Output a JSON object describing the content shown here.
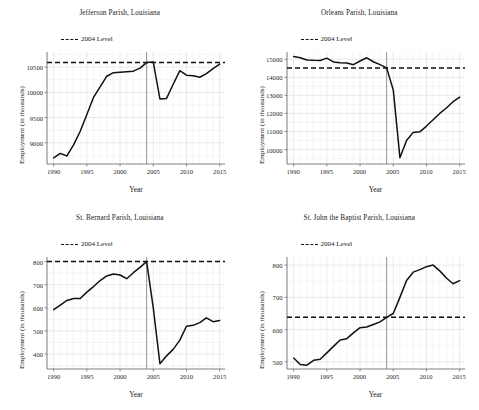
{
  "figure": {
    "shared_xlabel": "Year",
    "shared_ylabel": "Employment (in thousands)",
    "legend_label": "2004 Level",
    "line_color": "#111111",
    "level_color": "#111111",
    "vline_color": "#7a7a82",
    "grid_color": "#d9d9e0"
  },
  "chart_data": [
    {
      "type": "line",
      "title": "Jefferson Parish, Louisiana",
      "xlabel": "Year",
      "ylabel": "Employment (in thousands)",
      "legend": [
        "2004 Level"
      ],
      "legend_position": "top-left",
      "grid": true,
      "xlim": [
        1989.0,
        2015.8
      ],
      "ylim": [
        8580,
        10800
      ],
      "xticks": [
        1990,
        1995,
        2000,
        2005,
        2010,
        2015
      ],
      "yticks": [
        9000,
        9500,
        10000,
        10500
      ],
      "level_2004": 10590,
      "vline_x": 2004,
      "x": [
        1990,
        1991,
        1992,
        1993,
        1994,
        1995,
        1996,
        1997,
        1998,
        1999,
        2000,
        2001,
        2002,
        2003,
        2004,
        2005,
        2006,
        2007,
        2008,
        2009,
        2010,
        2011,
        2012,
        2013,
        2014,
        2015
      ],
      "values": [
        8700,
        8790,
        8740,
        8960,
        9230,
        9560,
        9900,
        10110,
        10320,
        10390,
        10400,
        10410,
        10420,
        10480,
        10590,
        10600,
        9870,
        9880,
        10160,
        10430,
        10340,
        10330,
        10300,
        10370,
        10470,
        10560,
        10700
      ]
    },
    {
      "type": "line",
      "title": "Orleans Parish, Louisiana",
      "xlabel": "Year",
      "ylabel": "Employment (in thousands)",
      "legend": [
        "2004 Level"
      ],
      "legend_position": "top-left",
      "grid": true,
      "xlim": [
        1989.0,
        2015.8
      ],
      "ylim": [
        9200,
        15400
      ],
      "xticks": [
        1990,
        1995,
        2000,
        2005,
        2010,
        2015
      ],
      "yticks": [
        10000,
        11000,
        12000,
        13000,
        14000,
        15000
      ],
      "level_2004": 14520,
      "vline_x": 2004,
      "x": [
        1990,
        1991,
        1992,
        1993,
        1994,
        1995,
        1996,
        1997,
        1998,
        1999,
        2000,
        2001,
        2002,
        2003,
        2004,
        2005,
        2006,
        2007,
        2008,
        2009,
        2010,
        2011,
        2012,
        2013,
        2014,
        2015
      ],
      "values": [
        15150,
        15080,
        14960,
        14940,
        14930,
        15060,
        14850,
        14800,
        14790,
        14700,
        14900,
        15080,
        14860,
        14700,
        14520,
        13300,
        9550,
        10500,
        10950,
        10980,
        11300,
        11650,
        12000,
        12300,
        12650,
        12900
      ]
    },
    {
      "type": "line",
      "title": "St. Bernard Parish, Louisiana",
      "xlabel": "Year",
      "ylabel": "Employment (in thousands)",
      "legend": [
        "2004 Level"
      ],
      "legend_position": "top-left",
      "grid": true,
      "xlim": [
        1989.0,
        2015.8
      ],
      "ylim": [
        335,
        820
      ],
      "xticks": [
        1990,
        1995,
        2000,
        2005,
        2010,
        2015
      ],
      "yticks": [
        400,
        500,
        600,
        700,
        800
      ],
      "level_2004": 800,
      "vline_x": 2004,
      "x": [
        1990,
        1991,
        1992,
        1993,
        1994,
        1995,
        1996,
        1997,
        1998,
        1999,
        2000,
        2001,
        2002,
        2003,
        2004,
        2005,
        2006,
        2007,
        2008,
        2009,
        2010,
        2011,
        2012,
        2013,
        2014,
        2015
      ],
      "values": [
        592,
        612,
        632,
        640,
        640,
        668,
        692,
        718,
        738,
        746,
        742,
        726,
        752,
        775,
        800,
        600,
        358,
        392,
        420,
        460,
        520,
        524,
        536,
        556,
        540,
        545
      ]
    },
    {
      "type": "line",
      "title": "St. John the Baptist Parish, Louisiana",
      "xlabel": "Year",
      "ylabel": "Employment (in thousands)",
      "legend": [
        "2004 Level"
      ],
      "legend_position": "top-left",
      "grid": true,
      "xlim": [
        1989.0,
        2015.8
      ],
      "ylim": [
        478,
        825
      ],
      "xticks": [
        1990,
        1995,
        2000,
        2005,
        2010,
        2015
      ],
      "yticks": [
        500,
        600,
        700,
        800
      ],
      "level_2004": 638,
      "vline_x": 2004,
      "x": [
        1990,
        1991,
        1992,
        1993,
        1994,
        1995,
        1996,
        1997,
        1998,
        1999,
        2000,
        2001,
        2002,
        2003,
        2004,
        2005,
        2006,
        2007,
        2008,
        2009,
        2010,
        2011,
        2012,
        2013,
        2014,
        2015
      ],
      "values": [
        512,
        492,
        490,
        505,
        508,
        528,
        548,
        568,
        572,
        590,
        606,
        608,
        616,
        624,
        638,
        650,
        700,
        752,
        778,
        786,
        795,
        800,
        782,
        760,
        742,
        752
      ]
    }
  ]
}
